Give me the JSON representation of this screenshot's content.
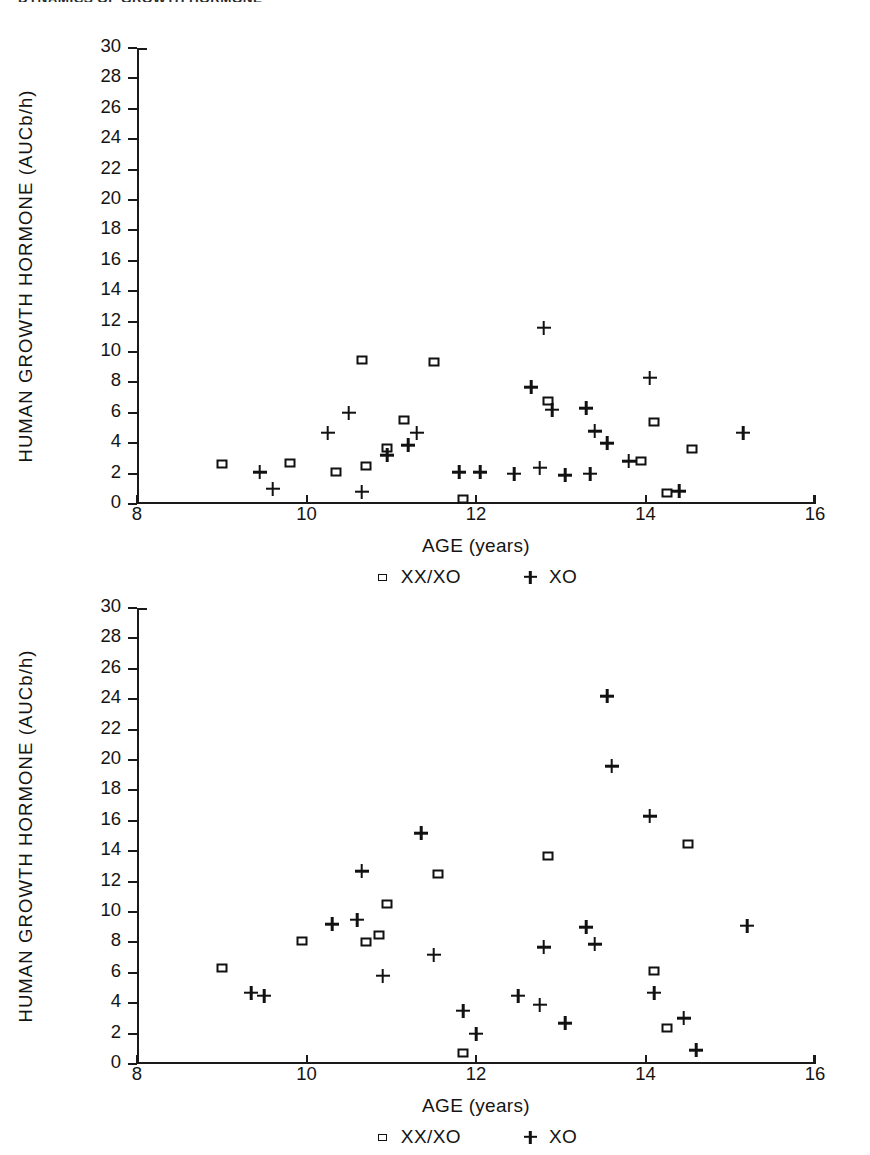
{
  "header": {
    "clipped_title": "DYNAMICS OF GROWTH HORMONE"
  },
  "labels": {
    "xaxis_title": "AGE  (years)",
    "yaxis_title": "HUMAN GROWTH HORMONE  (AUCb/h)",
    "legend_square": "XX/XO",
    "legend_plus": "XO",
    "ytick_labels": [
      "0",
      "2",
      "4",
      "6",
      "8",
      "10",
      "12",
      "14",
      "16",
      "18",
      "20",
      "22",
      "24",
      "26",
      "28",
      "30"
    ],
    "xtick_labels": [
      "8",
      "10",
      "12",
      "14",
      "16"
    ]
  },
  "chart_data": [
    {
      "id": "panel-top",
      "type": "scatter",
      "title": "",
      "xlabel": "AGE  (years)",
      "ylabel": "HUMAN GROWTH HORMONE  (AUCb/h)",
      "xlim": [
        8,
        16
      ],
      "ylim": [
        0,
        30
      ],
      "xticks": [
        8,
        10,
        12,
        14,
        16
      ],
      "yticks": [
        0,
        2,
        4,
        6,
        8,
        10,
        12,
        14,
        16,
        18,
        20,
        22,
        24,
        26,
        28,
        30
      ],
      "grid": false,
      "legend_position": "below-axis-center",
      "series": [
        {
          "name": "XX/XO",
          "marker": "square",
          "points": [
            [
              9.0,
              2.6
            ],
            [
              9.8,
              2.7
            ],
            [
              10.35,
              2.1
            ],
            [
              10.65,
              9.5
            ],
            [
              10.7,
              2.5
            ],
            [
              10.95,
              3.7
            ],
            [
              11.15,
              5.5
            ],
            [
              11.5,
              9.35
            ],
            [
              11.85,
              0.3
            ],
            [
              12.85,
              6.8
            ],
            [
              13.95,
              2.85
            ],
            [
              14.1,
              5.4
            ],
            [
              14.25,
              0.7
            ],
            [
              14.55,
              3.6
            ]
          ]
        },
        {
          "name": "XO",
          "marker": "plus",
          "points": [
            [
              9.45,
              2.1
            ],
            [
              9.6,
              1.0
            ],
            [
              10.25,
              4.7
            ],
            [
              10.5,
              6.0
            ],
            [
              10.65,
              0.8
            ],
            [
              10.95,
              3.2
            ],
            [
              11.3,
              4.7
            ],
            [
              11.2,
              3.85
            ],
            [
              11.8,
              2.1
            ],
            [
              12.05,
              2.1
            ],
            [
              12.45,
              2.0
            ],
            [
              12.8,
              11.6
            ],
            [
              12.65,
              7.7
            ],
            [
              12.9,
              6.2
            ],
            [
              12.75,
              2.4
            ],
            [
              13.05,
              1.9
            ],
            [
              13.3,
              6.3
            ],
            [
              13.35,
              2.0
            ],
            [
              13.4,
              4.8
            ],
            [
              13.55,
              4.0
            ],
            [
              13.8,
              2.8
            ],
            [
              14.05,
              8.3
            ],
            [
              14.4,
              0.85
            ],
            [
              15.15,
              4.7
            ]
          ]
        }
      ]
    },
    {
      "id": "panel-bottom",
      "type": "scatter",
      "title": "",
      "xlabel": "AGE  (years)",
      "ylabel": "HUMAN GROWTH HORMONE  (AUCb/h)",
      "xlim": [
        8,
        16
      ],
      "ylim": [
        0,
        30
      ],
      "xticks": [
        8,
        10,
        12,
        14,
        16
      ],
      "yticks": [
        0,
        2,
        4,
        6,
        8,
        10,
        12,
        14,
        16,
        18,
        20,
        22,
        24,
        26,
        28,
        30
      ],
      "grid": false,
      "legend_position": "below-axis-center",
      "series": [
        {
          "name": "XX/XO",
          "marker": "square",
          "points": [
            [
              9.0,
              6.3
            ],
            [
              9.95,
              8.1
            ],
            [
              10.7,
              8.0
            ],
            [
              10.85,
              8.5
            ],
            [
              10.95,
              10.5
            ],
            [
              11.55,
              12.5
            ],
            [
              11.85,
              0.7
            ],
            [
              12.85,
              13.7
            ],
            [
              14.1,
              6.1
            ],
            [
              14.25,
              2.4
            ],
            [
              14.5,
              14.5
            ]
          ]
        },
        {
          "name": "XO",
          "marker": "plus",
          "points": [
            [
              9.35,
              4.7
            ],
            [
              9.5,
              4.5
            ],
            [
              10.3,
              9.2
            ],
            [
              10.6,
              9.5
            ],
            [
              10.65,
              12.7
            ],
            [
              10.9,
              5.8
            ],
            [
              11.35,
              15.2
            ],
            [
              11.5,
              7.2
            ],
            [
              11.85,
              3.5
            ],
            [
              12.0,
              2.0
            ],
            [
              12.5,
              4.5
            ],
            [
              12.75,
              3.9
            ],
            [
              12.8,
              7.7
            ],
            [
              13.05,
              2.7
            ],
            [
              13.3,
              9.0
            ],
            [
              13.4,
              7.9
            ],
            [
              13.55,
              24.2
            ],
            [
              13.6,
              19.6
            ],
            [
              14.05,
              16.3
            ],
            [
              14.1,
              4.7
            ],
            [
              14.45,
              3.0
            ],
            [
              14.6,
              0.9
            ],
            [
              15.2,
              9.1
            ]
          ]
        }
      ]
    }
  ]
}
